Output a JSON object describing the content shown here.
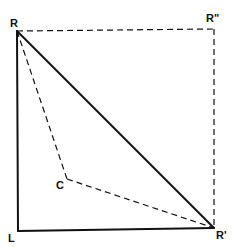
{
  "diagram": {
    "type": "geometric-vector-diagram",
    "colors": {
      "stroke": "#111111",
      "background": "#ffffff"
    },
    "points": {
      "R": {
        "label": "R",
        "x": 17,
        "y": 31
      },
      "R_double_prime": {
        "label": "R\"",
        "x": 214,
        "y": 29
      },
      "R_prime": {
        "label": "R'",
        "x": 214,
        "y": 228
      },
      "L": {
        "label": "L",
        "x": 18,
        "y": 231
      },
      "C": {
        "label": "C",
        "x": 67,
        "y": 179
      }
    },
    "solid_lines": [
      {
        "from": "R",
        "to": "L"
      },
      {
        "from": "L",
        "to": "R_prime"
      },
      {
        "from": "R",
        "to": "R_prime"
      }
    ],
    "dashed_lines": [
      {
        "from": "R",
        "to": "R_double_prime"
      },
      {
        "from": "R_double_prime",
        "to": "R_prime"
      },
      {
        "from": "R",
        "to": "C"
      },
      {
        "from": "C",
        "to": "R_prime"
      }
    ]
  }
}
